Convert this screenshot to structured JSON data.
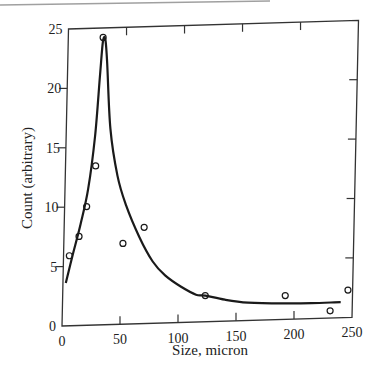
{
  "chart_data": {
    "type": "scatter",
    "title": "",
    "xlabel": "Size, micron",
    "ylabel": "Count (arbitrary)",
    "xlim": [
      0,
      250
    ],
    "ylim": [
      0,
      25
    ],
    "grid": false,
    "legend": null,
    "x_ticks": [
      "0",
      "50",
      "100",
      "150",
      "200",
      "250"
    ],
    "y_ticks": [
      "0",
      "5",
      "10",
      "15",
      "20",
      "25"
    ],
    "series": [
      {
        "name": "measured",
        "kind": "scatter",
        "marker": "open-circle",
        "x": [
          5,
          13,
          19,
          26,
          30,
          51,
          69,
          123,
          192,
          231,
          246
        ],
        "y": [
          5.9,
          7.5,
          10.0,
          13.4,
          24.2,
          6.8,
          8.1,
          2.2,
          2.0,
          0.6,
          2.3
        ]
      },
      {
        "name": "fitted curve",
        "kind": "line",
        "x": [
          2.5,
          8,
          14,
          20,
          25,
          28,
          30,
          32,
          34,
          38,
          45,
          53,
          65,
          77,
          88,
          102,
          115,
          123,
          140,
          160,
          190,
          215,
          240
        ],
        "y": [
          3.6,
          6.0,
          8.5,
          11.5,
          16.0,
          21.0,
          23.9,
          24.0,
          22.0,
          16.5,
          12.5,
          10.0,
          7.3,
          5.2,
          4.0,
          3.0,
          2.3,
          2.2,
          1.8,
          1.5,
          1.35,
          1.3,
          1.3
        ]
      }
    ]
  },
  "axes": {
    "xlabel": "Size, micron",
    "ylabel": "Count (arbitrary)",
    "x_tick_labels": [
      "0",
      "50",
      "100",
      "150",
      "200",
      "250"
    ],
    "y_tick_labels": [
      "0",
      "5",
      "10",
      "15",
      "20",
      "25"
    ]
  },
  "colors": {
    "ink": "#1a1a1a",
    "frame": "#333333",
    "page_edge": "#9a9a9a",
    "background": "#ffffff"
  }
}
